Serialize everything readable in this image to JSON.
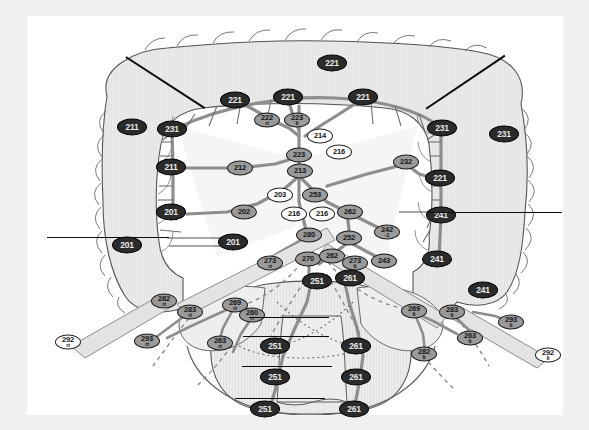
{
  "figure": {
    "background_color": "#ffffff",
    "frame_color": "#f0f0f0",
    "node_dark_color": "#2b2b2b",
    "node_mid_color": "#9a9a9a",
    "node_light_color": "#ffffff",
    "organ_fill_color": "#e8e8e8",
    "vessel_color": "#8e8e8e",
    "line_color": "#0b0b0b"
  },
  "nodes": [
    {
      "id": "n221-top",
      "label": "221",
      "side": "",
      "style": "dark",
      "size": "l",
      "x": 305,
      "y": 47
    },
    {
      "id": "n221-l",
      "label": "221",
      "side": "",
      "style": "dark",
      "size": "l",
      "x": 208,
      "y": 84
    },
    {
      "id": "n221-c",
      "label": "221",
      "side": "",
      "style": "dark",
      "size": "l",
      "x": 261,
      "y": 81
    },
    {
      "id": "n221-r",
      "label": "221",
      "side": "",
      "style": "dark",
      "size": "l",
      "x": 336,
      "y": 81
    },
    {
      "id": "n222rt",
      "label": "222",
      "side": "rt",
      "style": "mid",
      "size": "m",
      "x": 240,
      "y": 104
    },
    {
      "id": "n223top",
      "label": "223",
      "side": "lt",
      "style": "mid",
      "size": "m",
      "x": 270,
      "y": 104
    },
    {
      "id": "n214",
      "label": "214",
      "side": "",
      "style": "light",
      "size": "m",
      "x": 293,
      "y": 120
    },
    {
      "id": "n216a",
      "label": "216",
      "side": "",
      "style": "light",
      "size": "m",
      "x": 312,
      "y": 136
    },
    {
      "id": "n223",
      "label": "223",
      "side": "",
      "style": "mid",
      "size": "m",
      "x": 272,
      "y": 139
    },
    {
      "id": "n213",
      "label": "213",
      "side": "",
      "style": "mid",
      "size": "m",
      "x": 273,
      "y": 155
    },
    {
      "id": "n212",
      "label": "212",
      "side": "",
      "style": "mid",
      "size": "m",
      "x": 213,
      "y": 152
    },
    {
      "id": "n232",
      "label": "232",
      "side": "",
      "style": "mid",
      "size": "m",
      "x": 379,
      "y": 146
    },
    {
      "id": "n203",
      "label": "203",
      "side": "",
      "style": "light",
      "size": "m",
      "x": 253,
      "y": 179
    },
    {
      "id": "n253",
      "label": "253",
      "side": "",
      "style": "mid",
      "size": "m",
      "x": 288,
      "y": 179
    },
    {
      "id": "n262",
      "label": "262",
      "side": "",
      "style": "mid",
      "size": "m",
      "x": 323,
      "y": 196
    },
    {
      "id": "n216b",
      "label": "216",
      "side": "",
      "style": "light",
      "size": "m",
      "x": 267,
      "y": 198
    },
    {
      "id": "n216c",
      "label": "216",
      "side": "",
      "style": "light",
      "size": "m",
      "x": 295,
      "y": 198
    },
    {
      "id": "n202",
      "label": "202",
      "side": "",
      "style": "mid",
      "size": "m",
      "x": 217,
      "y": 196
    },
    {
      "id": "n242-1",
      "label": "242",
      "side": "-1",
      "style": "mid",
      "size": "m",
      "x": 360,
      "y": 216
    },
    {
      "id": "n280",
      "label": "280",
      "side": "",
      "style": "mid",
      "size": "m",
      "x": 282,
      "y": 219
    },
    {
      "id": "n252",
      "label": "252",
      "side": "",
      "style": "mid",
      "size": "m",
      "x": 322,
      "y": 222
    },
    {
      "id": "n270",
      "label": "270",
      "side": "",
      "style": "mid",
      "size": "m",
      "x": 281,
      "y": 243
    },
    {
      "id": "n262b",
      "label": "262",
      "side": "",
      "style": "mid",
      "size": "m",
      "x": 305,
      "y": 240
    },
    {
      "id": "n273rt",
      "label": "273",
      "side": "rt",
      "style": "mid",
      "size": "m",
      "x": 243,
      "y": 247
    },
    {
      "id": "n273lt",
      "label": "273",
      "side": "lt",
      "style": "mid",
      "size": "m",
      "x": 328,
      "y": 247
    },
    {
      "id": "n243",
      "label": "243",
      "side": "",
      "style": "mid",
      "size": "m",
      "x": 357,
      "y": 245
    },
    {
      "id": "n251",
      "label": "251",
      "side": "",
      "style": "dark",
      "size": "l",
      "x": 290,
      "y": 265
    },
    {
      "id": "n261",
      "label": "261",
      "side": "",
      "style": "dark",
      "size": "l",
      "x": 323,
      "y": 262
    },
    {
      "id": "n211-l",
      "label": "211",
      "side": "",
      "style": "dark",
      "size": "l",
      "x": 105,
      "y": 111
    },
    {
      "id": "n231-l",
      "label": "231",
      "side": "",
      "style": "dark",
      "size": "l",
      "x": 145,
      "y": 113
    },
    {
      "id": "n211b",
      "label": "211",
      "side": "",
      "style": "dark",
      "size": "l",
      "x": 144,
      "y": 151
    },
    {
      "id": "n201",
      "label": "201",
      "side": "",
      "style": "dark",
      "size": "l",
      "x": 144,
      "y": 196
    },
    {
      "id": "n201b",
      "label": "201",
      "side": "",
      "style": "dark",
      "size": "l",
      "x": 100,
      "y": 229
    },
    {
      "id": "n201c",
      "label": "201",
      "side": "",
      "style": "dark",
      "size": "l",
      "x": 206,
      "y": 226
    },
    {
      "id": "n231-r",
      "label": "231",
      "side": "",
      "style": "dark",
      "size": "l",
      "x": 415,
      "y": 112
    },
    {
      "id": "n231-rr",
      "label": "231",
      "side": "",
      "style": "dark",
      "size": "l",
      "x": 477,
      "y": 118
    },
    {
      "id": "n221-rr",
      "label": "221",
      "side": "",
      "style": "dark",
      "size": "l",
      "x": 413,
      "y": 162
    },
    {
      "id": "n241",
      "label": "241",
      "side": "",
      "style": "dark",
      "size": "l",
      "x": 414,
      "y": 199
    },
    {
      "id": "n241b",
      "label": "241",
      "side": "",
      "style": "dark",
      "size": "l",
      "x": 410,
      "y": 243
    },
    {
      "id": "n241c",
      "label": "241",
      "side": "",
      "style": "dark",
      "size": "l",
      "x": 456,
      "y": 274
    },
    {
      "id": "n282rt",
      "label": "282",
      "side": "rt",
      "style": "mid",
      "size": "m",
      "x": 137,
      "y": 285
    },
    {
      "id": "n283rt",
      "label": "283",
      "side": "rt",
      "style": "mid",
      "size": "m",
      "x": 163,
      "y": 296
    },
    {
      "id": "n269rt",
      "label": "269",
      "side": "rt",
      "style": "mid",
      "size": "m",
      "x": 208,
      "y": 289
    },
    {
      "id": "n260rt",
      "label": "260",
      "side": "rt",
      "style": "mid",
      "size": "m",
      "x": 225,
      "y": 299
    },
    {
      "id": "n293rt",
      "label": "293",
      "side": "rt",
      "style": "mid",
      "size": "m",
      "x": 120,
      "y": 325
    },
    {
      "id": "n292rt",
      "label": "292",
      "side": "rt",
      "style": "light",
      "size": "m",
      "x": 41,
      "y": 326
    },
    {
      "id": "n263rt",
      "label": "263",
      "side": "rt",
      "style": "mid",
      "size": "m",
      "x": 193,
      "y": 327
    },
    {
      "id": "n269lt",
      "label": "269",
      "side": "lt",
      "style": "mid",
      "size": "m",
      "x": 387,
      "y": 295
    },
    {
      "id": "n283lt",
      "label": "283",
      "side": "lt",
      "style": "mid",
      "size": "m",
      "x": 425,
      "y": 296
    },
    {
      "id": "n293lt",
      "label": "293",
      "side": "lt",
      "style": "mid",
      "size": "m",
      "x": 484,
      "y": 306
    },
    {
      "id": "n263lt",
      "label": "263",
      "side": "lt",
      "style": "mid",
      "size": "m",
      "x": 443,
      "y": 322
    },
    {
      "id": "n282lt",
      "label": "282",
      "side": "lt",
      "style": "mid",
      "size": "m",
      "x": 397,
      "y": 338
    },
    {
      "id": "n292lt",
      "label": "292",
      "side": "lt",
      "style": "light",
      "size": "m",
      "x": 521,
      "y": 339
    },
    {
      "id": "n251b",
      "label": "251",
      "side": "",
      "style": "dark",
      "size": "l",
      "x": 248,
      "y": 330
    },
    {
      "id": "n261b",
      "label": "261",
      "side": "",
      "style": "dark",
      "size": "l",
      "x": 329,
      "y": 330
    },
    {
      "id": "n251c",
      "label": "251",
      "side": "",
      "style": "dark",
      "size": "l",
      "x": 248,
      "y": 361
    },
    {
      "id": "n261c",
      "label": "261",
      "side": "",
      "style": "dark",
      "size": "l",
      "x": 329,
      "y": 361
    },
    {
      "id": "n251d",
      "label": "251",
      "side": "",
      "style": "dark",
      "size": "l",
      "x": 238,
      "y": 393
    },
    {
      "id": "n261d",
      "label": "261",
      "side": "",
      "style": "dark",
      "size": "l",
      "x": 327,
      "y": 393
    }
  ],
  "rules": [
    {
      "id": "rule-right-upper",
      "orientation": "horizontal",
      "x": 401,
      "y": 196,
      "length": 134
    },
    {
      "id": "rule-left-mid",
      "orientation": "horizontal",
      "x": 20,
      "y": 221,
      "length": 122
    },
    {
      "id": "rule-pelvis-1",
      "orientation": "horizontal",
      "x": 222,
      "y": 301,
      "length": 80
    },
    {
      "id": "rule-pelvis-2",
      "orientation": "horizontal",
      "x": 216,
      "y": 320,
      "length": 86
    },
    {
      "id": "rule-pelvis-3",
      "orientation": "horizontal",
      "x": 215,
      "y": 350,
      "length": 90
    },
    {
      "id": "rule-pelvis-4",
      "orientation": "horizontal",
      "x": 208,
      "y": 382,
      "length": 90
    }
  ],
  "pointers": [
    {
      "id": "pointer-upper-left",
      "x1": 99,
      "y1": 40,
      "x2": 178,
      "y2": 91
    },
    {
      "id": "pointer-upper-right",
      "x1": 478,
      "y1": 39,
      "x2": 399,
      "y2": 92
    }
  ]
}
